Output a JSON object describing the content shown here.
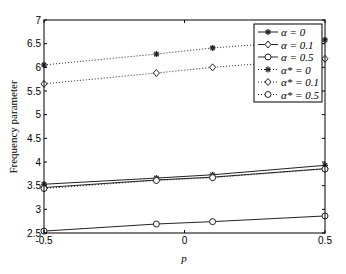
{
  "chart_data": {
    "type": "line",
    "title": "",
    "xlabel": "p",
    "ylabel": "Frequency parameter",
    "xlim": [
      -0.5,
      0.5
    ],
    "ylim": [
      2.5,
      7
    ],
    "grid": false,
    "legend_position": "upper right (inside)",
    "x_ticks": [
      -0.5,
      0,
      0.5
    ],
    "x_tick_labels": [
      "-0.5",
      "0",
      "0.5"
    ],
    "y_ticks": [
      2.5,
      3,
      3.5,
      4,
      4.5,
      5,
      5.5,
      6,
      6.5,
      7
    ],
    "y_tick_labels": [
      "2.5",
      "3",
      "3.5",
      "4",
      "4.5",
      "5",
      "5.5",
      "6",
      "6.5",
      "7"
    ],
    "x": [
      -0.5,
      -0.1,
      0.1,
      0.5
    ],
    "series": [
      {
        "name": "α = 0",
        "line": "solid",
        "marker": "star",
        "values": [
          3.53,
          3.66,
          3.73,
          3.93
        ]
      },
      {
        "name": "α = 0.1",
        "line": "solid",
        "marker": "diamond",
        "values": [
          3.46,
          3.62,
          3.68,
          3.86
        ]
      },
      {
        "name": "α = 0.5",
        "line": "solid",
        "marker": "circle",
        "values": [
          2.54,
          2.69,
          2.74,
          2.86
        ]
      },
      {
        "name": "α* = 0",
        "line": "dotted",
        "marker": "star",
        "values": [
          6.05,
          6.28,
          6.41,
          6.58
        ]
      },
      {
        "name": "α* = 0.1",
        "line": "dotted",
        "marker": "diamond",
        "values": [
          5.65,
          5.88,
          6.0,
          6.18
        ]
      },
      {
        "name": "α* = 0.5",
        "line": "dotted",
        "marker": "circle",
        "values": [
          3.44,
          3.61,
          3.67,
          3.85
        ]
      }
    ]
  },
  "legend": {
    "items": [
      {
        "label": "α = 0"
      },
      {
        "label": "α = 0.1"
      },
      {
        "label": "α = 0.5"
      },
      {
        "label": "α* = 0"
      },
      {
        "label": "α* = 0.1"
      },
      {
        "label": "α* = 0.5"
      }
    ]
  },
  "colors": {
    "axis": "#000000",
    "line": "#222222",
    "background": "#ffffff"
  }
}
